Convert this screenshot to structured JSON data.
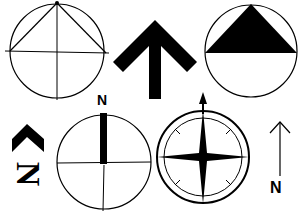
{
  "colors": {
    "ink": "#000000",
    "paper": "#ffffff"
  },
  "symbols": [
    {
      "id": "circle-triangle-outline",
      "description": "Circle with inscribed outline triangle and crosshair"
    },
    {
      "id": "bold-chevron-arrow",
      "description": "Bold block arrow pointing up"
    },
    {
      "id": "circle-filled-triangle",
      "description": "Circle with filled upper triangle"
    },
    {
      "id": "rotated-chevron-n",
      "description": "Chevron with rotated N letter",
      "label": "N"
    },
    {
      "id": "circle-bar-n",
      "description": "Circle with crosshair and bold north bar",
      "label": "N"
    },
    {
      "id": "compass-rose",
      "description": "Double-ring compass rose with four-point star and arrow"
    },
    {
      "id": "simple-arrow-n",
      "description": "Thin arrow with N below",
      "label": "N"
    }
  ]
}
